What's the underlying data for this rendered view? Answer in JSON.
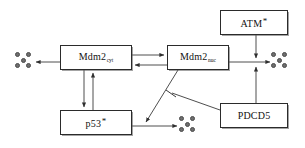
{
  "diagram": {
    "canvas": {
      "width": 305,
      "height": 148
    },
    "style": {
      "box_border_color": "#2b2b2b",
      "box_fill_color": "#ffffff",
      "line_color": "#3a3a3a",
      "degradation_dot_color": "#6e6e6e",
      "background_color": "#ffffff"
    },
    "nodes": [
      {
        "id": "mdm2_cyt",
        "name": "mdm2-cyt-box",
        "label_main": "Mdm2",
        "label_sub": "cyt",
        "label_star": "",
        "x": 60,
        "y": 45,
        "w": 72,
        "h": 25
      },
      {
        "id": "mdm2_nuc",
        "name": "mdm2-nuc-box",
        "label_main": "Mdm2",
        "label_sub": "nuc",
        "label_star": "",
        "x": 167,
        "y": 45,
        "w": 62,
        "h": 25
      },
      {
        "id": "p53",
        "name": "p53-box",
        "label_main": "p53",
        "label_sub": "",
        "label_star": "*",
        "x": 60,
        "y": 110,
        "w": 72,
        "h": 25
      },
      {
        "id": "atm",
        "name": "atm-box",
        "label_main": "ATM",
        "label_sub": "",
        "label_star": "*",
        "x": 220,
        "y": 10,
        "w": 68,
        "h": 25
      },
      {
        "id": "pdcd5",
        "name": "pdcd5-box",
        "label_main": "PDCD5",
        "label_sub": "",
        "label_star": "",
        "x": 220,
        "y": 103,
        "w": 68,
        "h": 25
      }
    ],
    "degradation_symbols": [
      {
        "id": "deg_left",
        "name": "degradation-symbol-left",
        "cx": 25,
        "cy": 62,
        "dot_count": 5
      },
      {
        "id": "deg_right",
        "name": "degradation-symbol-right",
        "cx": 281,
        "cy": 62,
        "dot_count": 5
      },
      {
        "id": "deg_bottom",
        "name": "degradation-symbol-bottom",
        "cx": 189,
        "cy": 126,
        "dot_count": 5
      }
    ],
    "edges": [
      {
        "id": "e1",
        "name": "edge-mdm2cyt-to-degradation-left",
        "from": "mdm2_cyt",
        "to": "deg_left",
        "kind": "arrow"
      },
      {
        "id": "e2",
        "name": "edge-mdm2cyt-to-mdm2nuc",
        "from": "mdm2_cyt",
        "to": "mdm2_nuc",
        "kind": "arrow"
      },
      {
        "id": "e3",
        "name": "edge-mdm2nuc-to-mdm2cyt",
        "from": "mdm2_nuc",
        "to": "mdm2_cyt",
        "kind": "arrow"
      },
      {
        "id": "e4",
        "name": "edge-mdm2cyt-to-p53",
        "from": "mdm2_cyt",
        "to": "p53",
        "kind": "arrow"
      },
      {
        "id": "e5",
        "name": "edge-p53-to-mdm2cyt",
        "from": "p53",
        "to": "mdm2_cyt",
        "kind": "arrow"
      },
      {
        "id": "e6",
        "name": "edge-p53-to-degradation-bottom",
        "from": "p53",
        "to": "deg_bottom",
        "kind": "arrow"
      },
      {
        "id": "e7",
        "name": "edge-mdm2nuc-to-p53-degradation",
        "from": "mdm2_nuc",
        "to": "deg_bottom",
        "kind": "arrow"
      },
      {
        "id": "e8",
        "name": "edge-mdm2nuc-to-degradation-right",
        "from": "mdm2_nuc",
        "to": "deg_right",
        "kind": "arrow"
      },
      {
        "id": "e9",
        "name": "edge-atm-to-mdm2nuc-degradation",
        "from": "atm",
        "to": "deg_right",
        "kind": "arrow"
      },
      {
        "id": "e10",
        "name": "edge-pdcd5-to-mdm2nuc-degradation",
        "from": "pdcd5",
        "to": "deg_right",
        "kind": "arrow"
      },
      {
        "id": "e11",
        "name": "edge-pdcd5-inhibits-mdm2nuc-p53-degradation",
        "from": "pdcd5",
        "to": "e7",
        "kind": "inhibition"
      }
    ]
  }
}
